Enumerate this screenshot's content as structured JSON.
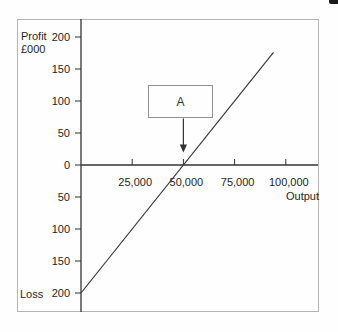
{
  "chart": {
    "profit_label": "Profit",
    "units_label": "£000",
    "loss_label": "Loss",
    "xlabel": "Output",
    "annotation": {
      "label": "A"
    }
  },
  "chart_data": {
    "type": "line",
    "title": "",
    "xlabel": "Output",
    "ylabel_top": "Profit £000",
    "ylabel_bottom": "Loss",
    "grid": false,
    "xlim": [
      0,
      116000
    ],
    "ylim": [
      -230,
      230
    ],
    "x_ticks": [
      {
        "value": 25000,
        "label": "25,000"
      },
      {
        "value": 50000,
        "label": "50,000"
      },
      {
        "value": 75000,
        "label": "75,000"
      },
      {
        "value": 100000,
        "label": "100,000"
      }
    ],
    "y_ticks": [
      {
        "value": 200,
        "label": "200"
      },
      {
        "value": 150,
        "label": "150"
      },
      {
        "value": 100,
        "label": "100"
      },
      {
        "value": 50,
        "label": "50"
      },
      {
        "value": 0,
        "label": "0"
      },
      {
        "value": -50,
        "label": "50"
      },
      {
        "value": -100,
        "label": "100"
      },
      {
        "value": -150,
        "label": "150"
      },
      {
        "value": -200,
        "label": "200"
      }
    ],
    "series": [
      {
        "name": "profit-line",
        "points": [
          [
            0,
            -200
          ],
          [
            94000,
            176
          ]
        ]
      }
    ],
    "breakeven_point": {
      "output": 50000,
      "profit": 0
    },
    "annotation": {
      "label": "A",
      "points_to_output": 50000
    },
    "colors": {
      "axis": "#333333",
      "line": "#3a3a3a",
      "text": "#262626",
      "frame": "#b5b5b5"
    }
  }
}
